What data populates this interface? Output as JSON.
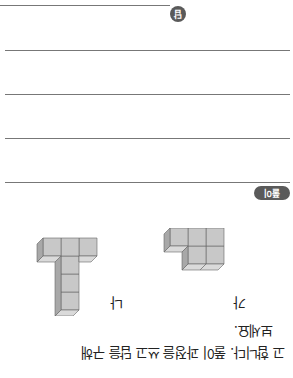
{
  "question": {
    "line1": "고 합니다. 풀이 과정을 쓰고 답을 구해",
    "line2": "보세요."
  },
  "figures": [
    {
      "label": "가",
      "description": "cube stack: 2x2 block with one extra cube on top-right"
    },
    {
      "label": "나",
      "description": "T-shaped cube stack: 3 cubes across top, 3-cube column below middle"
    }
  ],
  "solution": {
    "badge": "풀이",
    "lines": 4
  },
  "answer": {
    "badge": "답"
  },
  "colors": {
    "badge_bg": "#5a5a5a",
    "cube_face": "#c8c8c8",
    "cube_top": "#dadada",
    "cube_side": "#a8a8a8",
    "rule": "#777777"
  }
}
